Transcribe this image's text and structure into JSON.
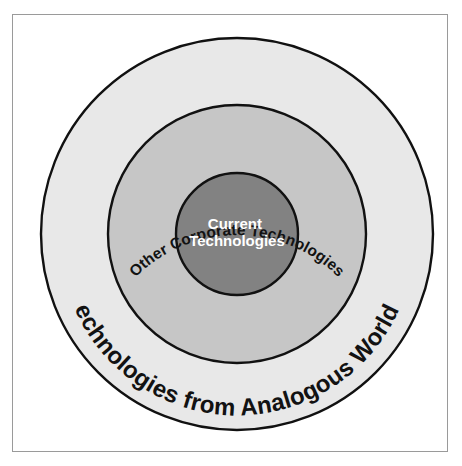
{
  "figure": {
    "type": "concentric-circles-diagram",
    "background_color": "#ffffff",
    "frame_border_color": "#9a9a9a",
    "stroke_color": "#111111"
  },
  "rings": {
    "outer": {
      "label": "Technologies from Analogous Worlds",
      "fill_color": "#e8e8e8",
      "text_color": "#121212",
      "diameter_px": 406
    },
    "middle": {
      "label": "Other Corporate Technologies",
      "fill_color": "#c6c6c6",
      "text_color": "#121212",
      "diameter_px": 260
    },
    "inner": {
      "label_line1": "Current",
      "label_line2": "Technologies",
      "fill_color": "#828282",
      "text_color": "#ffffff",
      "diameter_px": 124
    }
  }
}
